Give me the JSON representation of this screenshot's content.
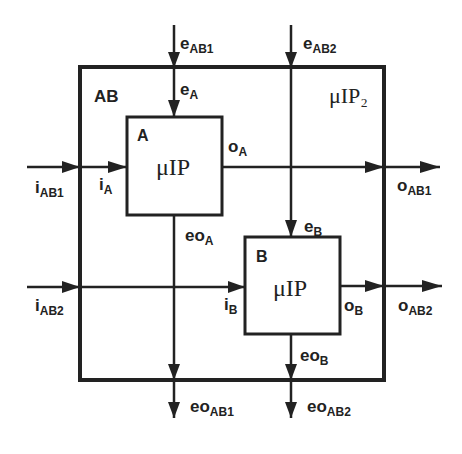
{
  "diagram": {
    "outer_block": {
      "name": "AB",
      "type_label": "μIP₂"
    },
    "block_a": {
      "name": "A",
      "type_label": "μIP"
    },
    "block_b": {
      "name": "B",
      "type_label": "μIP"
    },
    "signals": {
      "e_ab1": {
        "base": "e",
        "sub": "AB1"
      },
      "e_ab2": {
        "base": "e",
        "sub": "AB2"
      },
      "e_a": {
        "base": "e",
        "sub": "A"
      },
      "e_b": {
        "base": "e",
        "sub": "B"
      },
      "i_ab1": {
        "base": "i",
        "sub": "AB1"
      },
      "i_ab2": {
        "base": "i",
        "sub": "AB2"
      },
      "i_a": {
        "base": "i",
        "sub": "A"
      },
      "i_b": {
        "base": "i",
        "sub": "B"
      },
      "o_a": {
        "base": "o",
        "sub": "A"
      },
      "o_b": {
        "base": "o",
        "sub": "B"
      },
      "o_ab1": {
        "base": "o",
        "sub": "AB1"
      },
      "o_ab2": {
        "base": "o",
        "sub": "AB2"
      },
      "eo_a": {
        "base": "eo",
        "sub": "A"
      },
      "eo_b": {
        "base": "eo",
        "sub": "B"
      },
      "eo_ab1": {
        "base": "eo",
        "sub": "AB1"
      },
      "eo_ab2": {
        "base": "eo",
        "sub": "AB2"
      }
    },
    "colors": {
      "stroke": "#222222",
      "background": "#ffffff"
    }
  }
}
